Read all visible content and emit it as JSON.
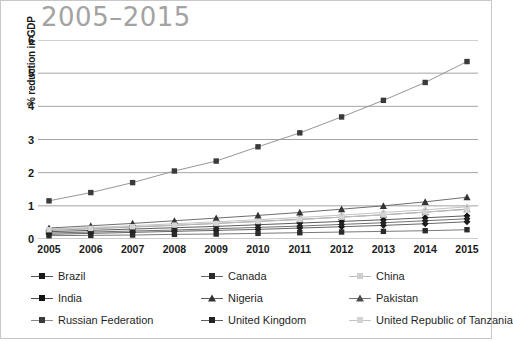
{
  "chart_data": {
    "type": "line",
    "title": "2005–2015",
    "xlabel": "",
    "ylabel": "% reduction in GDP",
    "categories": [
      "2005",
      "2006",
      "2007",
      "2008",
      "2009",
      "2010",
      "2011",
      "2012",
      "2013",
      "2014",
      "2015"
    ],
    "ylim": [
      0,
      6
    ],
    "yticks": [
      0,
      1,
      2,
      3,
      4,
      5,
      6
    ],
    "grid": "horizontal",
    "legend_position": "bottom",
    "series": [
      {
        "name": "Brazil",
        "marker": "diamond",
        "color": "#1a1a1a",
        "line_color": "#555555",
        "values": [
          0.14,
          0.17,
          0.2,
          0.23,
          0.26,
          0.29,
          0.33,
          0.37,
          0.41,
          0.46,
          0.52
        ]
      },
      {
        "name": "Canada",
        "marker": "square",
        "color": "#2b2b2b",
        "line_color": "#6a6a6a",
        "values": [
          0.1,
          0.11,
          0.12,
          0.14,
          0.15,
          0.17,
          0.19,
          0.21,
          0.23,
          0.25,
          0.28
        ]
      },
      {
        "name": "China",
        "marker": "diamond",
        "color": "#cfcfcf",
        "line_color": "#bdbdbd",
        "values": [
          0.3,
          0.35,
          0.4,
          0.46,
          0.52,
          0.58,
          0.65,
          0.72,
          0.8,
          0.88,
          0.97
        ]
      },
      {
        "name": "India",
        "marker": "diamond",
        "color": "#111111",
        "line_color": "#4a4a4a",
        "values": [
          0.22,
          0.26,
          0.3,
          0.34,
          0.38,
          0.43,
          0.48,
          0.53,
          0.58,
          0.64,
          0.7
        ]
      },
      {
        "name": "Nigeria",
        "marker": "triangle",
        "color": "#333333",
        "line_color": "#5e5e5e",
        "values": [
          0.33,
          0.4,
          0.47,
          0.55,
          0.63,
          0.71,
          0.8,
          0.9,
          1.0,
          1.12,
          1.26
        ]
      },
      {
        "name": "Pakistan",
        "marker": "triangle",
        "color": "#4d4d4d",
        "line_color": "#777777",
        "values": [
          0.26,
          0.31,
          0.36,
          0.41,
          0.47,
          0.53,
          0.59,
          0.66,
          0.73,
          0.81,
          0.9
        ]
      },
      {
        "name": "Russian Federation",
        "marker": "square",
        "color": "#3a3a3a",
        "line_color": "#8a8a8a",
        "values": [
          1.15,
          1.4,
          1.7,
          2.05,
          2.35,
          2.78,
          3.2,
          3.68,
          4.18,
          4.72,
          5.35
        ]
      },
      {
        "name": "United Kingdom",
        "marker": "diamond",
        "color": "#222222",
        "line_color": "#606060",
        "values": [
          0.18,
          0.21,
          0.24,
          0.27,
          0.31,
          0.35,
          0.39,
          0.44,
          0.49,
          0.55,
          0.61
        ]
      },
      {
        "name": "United Republic of Tanzania",
        "marker": "square",
        "color": "#d4d4d4",
        "line_color": "#c4c4c4",
        "values": [
          0.28,
          0.32,
          0.37,
          0.42,
          0.47,
          0.53,
          0.59,
          0.66,
          0.73,
          0.81,
          0.89
        ]
      }
    ]
  },
  "legend": {
    "items": [
      {
        "label": "Brazil"
      },
      {
        "label": "Canada"
      },
      {
        "label": "China"
      },
      {
        "label": "India"
      },
      {
        "label": "Nigeria"
      },
      {
        "label": "Pakistan"
      },
      {
        "label": "Russian Federation"
      },
      {
        "label": "United Kingdom"
      },
      {
        "label": "United Republic of Tanzania"
      }
    ]
  },
  "colors": {
    "grid": "#9a9a9a",
    "title": "#a3a3a3",
    "text": "#1a1a1a",
    "border": "#c8c8c8"
  }
}
